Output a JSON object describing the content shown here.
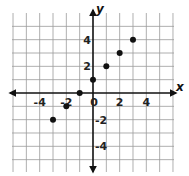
{
  "chart_data": {
    "type": "scatter",
    "title": "",
    "xlabel": "x",
    "ylabel": "y",
    "xlim": [
      -6,
      6
    ],
    "ylim": [
      -6,
      6
    ],
    "grid": true,
    "x_tick_labels": [
      "-4",
      "-2",
      "0",
      "2",
      "4"
    ],
    "x_tick_values": [
      -4,
      -2,
      0,
      2,
      4
    ],
    "y_tick_labels": [
      "4",
      "2",
      "-2",
      "-4"
    ],
    "y_tick_values": [
      4,
      2,
      -2,
      -4
    ],
    "series": [
      {
        "name": "points",
        "x": [
          -3,
          -2,
          -1,
          0,
          1,
          2,
          3
        ],
        "y": [
          -2,
          -1,
          0,
          1,
          2,
          3,
          4
        ]
      }
    ],
    "colors": {
      "grid": "#9a9a9a",
      "axis": "#111111",
      "point": "#111111"
    }
  }
}
